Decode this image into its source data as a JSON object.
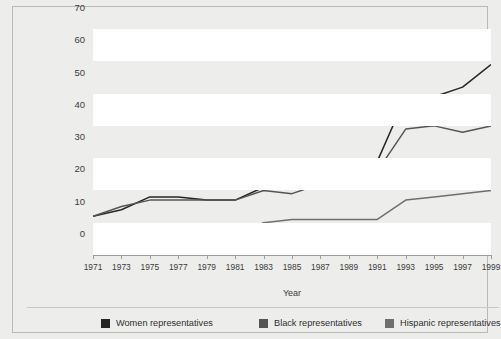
{
  "chart_data": {
    "type": "line",
    "title": "",
    "xlabel": "Year",
    "ylabel": "Number of Representatives",
    "x": [
      1971,
      1973,
      1975,
      1977,
      1979,
      1981,
      1983,
      1985,
      1987,
      1989,
      1991,
      1993,
      1995,
      1997,
      1999
    ],
    "xlim": [
      1971,
      1999
    ],
    "ylim": [
      0,
      70
    ],
    "yticks": [
      0,
      10,
      20,
      30,
      40,
      50,
      60,
      70
    ],
    "xticks": [
      "1971",
      "1973",
      "1975",
      "1977",
      "1979",
      "1981",
      "1983",
      "1985",
      "1987",
      "1989",
      "1991",
      "1993",
      "1995",
      "1997",
      "1999"
    ],
    "grid": "horizontal-banded",
    "legend_position": "bottom",
    "series": [
      {
        "name": "Women representatives",
        "color": "#262626",
        "values": [
          12,
          14,
          18,
          18,
          17,
          17,
          21,
          22,
          23,
          25,
          29,
          49,
          49,
          52,
          59
        ]
      },
      {
        "name": "Black representatives",
        "color": "#555555",
        "values": [
          12,
          15,
          17,
          17,
          17,
          17,
          20,
          19,
          22,
          24,
          26,
          39,
          40,
          38,
          40
        ]
      },
      {
        "name": "Hispanic representatives",
        "color": "#6f6f6f",
        "values": [
          5,
          5,
          5,
          5,
          5,
          6,
          10,
          11,
          11,
          11,
          11,
          17,
          18,
          19,
          20
        ]
      }
    ]
  },
  "axes": {
    "y_title": "Number of Representatives",
    "x_title": "Year"
  },
  "legend": {
    "items": [
      {
        "label": "Women representatives",
        "color": "#262626"
      },
      {
        "label": "Black representatives",
        "color": "#555555"
      },
      {
        "label": "Hispanic representatives",
        "color": "#6f6f6f"
      }
    ]
  },
  "colors": {
    "page_background": "#ededeb",
    "band": "#ffffff",
    "axis": "#9c9c9a",
    "text": "#3b3b3b"
  }
}
